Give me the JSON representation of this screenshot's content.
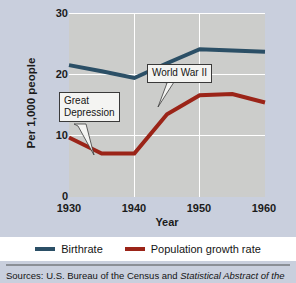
{
  "chart_data": {
    "type": "line",
    "title": "",
    "xlabel": "Year",
    "ylabel": "Per 1,000 people",
    "xlim": [
      1930,
      1960
    ],
    "ylim": [
      0,
      30
    ],
    "xticks": [
      "1930",
      "1940",
      "1950",
      "1960"
    ],
    "yticks": [
      "30",
      "20",
      "10",
      "0"
    ],
    "grid": true,
    "legend_position": "bottom",
    "x": [
      1930,
      1935,
      1940,
      1945,
      1950,
      1955,
      1960
    ],
    "series": [
      {
        "name": "Birthrate",
        "color": "#2b4f66",
        "values": [
          21.5,
          20.5,
          19.4,
          21.8,
          24.1,
          23.9,
          23.7
        ]
      },
      {
        "name": "Population growth rate",
        "color": "#9b2418",
        "values": [
          9.7,
          7.1,
          7.1,
          13.5,
          16.6,
          16.8,
          15.4
        ]
      }
    ],
    "annotations": [
      {
        "label": "Great\nDepression",
        "target_x": 1934,
        "target_y": 7.1
      },
      {
        "label": "World War II",
        "target_x": 1944,
        "target_y": 13.0
      }
    ]
  },
  "axes": {
    "y_title": "Per 1,000 people",
    "x_title": "Year",
    "y_ticks": [
      "30",
      "20",
      "10",
      "0"
    ],
    "x_ticks": [
      "1930",
      "1940",
      "1950",
      "1960"
    ]
  },
  "annotations": {
    "great_depression": "Great\nDepression",
    "world_war_two": "World War II"
  },
  "legend": {
    "items": [
      {
        "label": "Birthrate",
        "color": "#2b4f66"
      },
      {
        "label": "Population growth rate",
        "color": "#9b2418"
      }
    ]
  },
  "footer": {
    "source_prefix": "Sources: U.S. Bureau of the Census and ",
    "source_italic": "Statistical Abstract of the"
  },
  "colors": {
    "page_background": "#c9cfdd",
    "plot_background": "#cccdcb",
    "gridline": "#ffffff",
    "birthrate": "#2b4f66",
    "growth_rate": "#9b2418",
    "text": "#141414"
  }
}
